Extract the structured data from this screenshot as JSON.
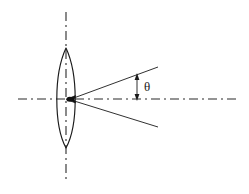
{
  "figure": {
    "type": "optical-ray-diagram",
    "title": "",
    "background_color": "#ffffff",
    "width": 249,
    "height": 194,
    "line_color": "#1a1a1a",
    "axis_color": "#2b2b2b"
  },
  "labels": {
    "angle_symbol": "θ"
  },
  "elements": {
    "lens": {
      "name": "biconvex-lens",
      "center_x": 66,
      "center_y": 99,
      "top_apex_y": 48,
      "bottom_apex_y": 148,
      "left_edge_x": 57,
      "right_edge_x": 75,
      "stroke": "#1a1a1a",
      "fill": "none"
    },
    "optical_axis": {
      "name": "horizontal-optical-axis",
      "x1": 18,
      "y1": 99,
      "x2": 240,
      "y2": 99,
      "style": "dash-dot"
    },
    "vertical_axis": {
      "name": "vertical-lens-axis",
      "x1": 66,
      "y1": 12,
      "x2": 66,
      "y2": 181,
      "style": "dash-dot"
    },
    "focal_point": {
      "name": "focal-point",
      "x": 72,
      "y": 99
    },
    "upper_ray": {
      "name": "upper-divergent-ray",
      "x1": 71,
      "y1": 99,
      "x2": 158,
      "y2": 67
    },
    "lower_ray": {
      "name": "lower-divergent-ray",
      "x1": 71,
      "y1": 100,
      "x2": 158,
      "y2": 127
    },
    "angle_arrow": {
      "name": "theta-dimension-arrow",
      "x": 137,
      "y_top": 75,
      "y_bottom": 99
    },
    "theta_text": {
      "name": "theta-text",
      "x": 145,
      "y": 90
    }
  }
}
